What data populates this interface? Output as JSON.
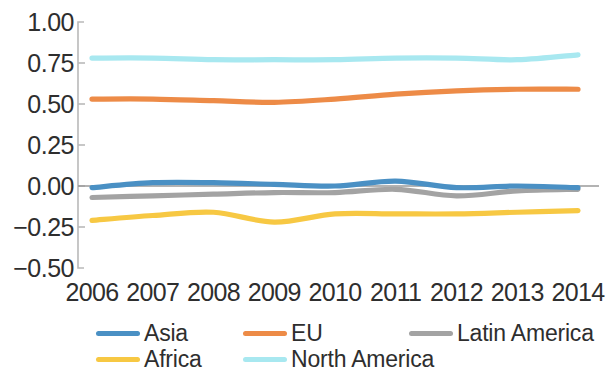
{
  "chart_data": {
    "type": "line",
    "title": "",
    "subtitle": "",
    "xlabel": "",
    "ylabel": "",
    "categories": [
      "2006",
      "2007",
      "2008",
      "2009",
      "2010",
      "2011",
      "2012",
      "2013",
      "2014"
    ],
    "x": [
      2006,
      2007,
      2008,
      2009,
      2010,
      2011,
      2012,
      2013,
      2014
    ],
    "ylim": [
      -0.5,
      1.0
    ],
    "ytick_labels": [
      "1.00",
      "0.75",
      "0.50",
      "0.25",
      "0.00",
      "-0.25",
      "-0.50"
    ],
    "ytick_values": [
      1.0,
      0.75,
      0.5,
      0.25,
      0.0,
      -0.25,
      -0.5
    ],
    "grid": false,
    "zero_line": true,
    "legend_position": "bottom",
    "series": [
      {
        "name": "Asia",
        "color": "#4A90C4",
        "values": [
          -0.01,
          0.02,
          0.02,
          0.01,
          0.0,
          0.03,
          -0.01,
          0.0,
          -0.01
        ]
      },
      {
        "name": "EU",
        "color": "#ED8B47",
        "values": [
          0.53,
          0.53,
          0.52,
          0.51,
          0.53,
          0.56,
          0.58,
          0.59,
          0.59
        ]
      },
      {
        "name": "Latin America",
        "color": "#A3A3A3",
        "values": [
          -0.07,
          -0.06,
          -0.05,
          -0.04,
          -0.04,
          -0.02,
          -0.06,
          -0.03,
          -0.02
        ]
      },
      {
        "name": "Africa",
        "color": "#F7C843",
        "values": [
          -0.21,
          -0.18,
          -0.16,
          -0.22,
          -0.17,
          -0.17,
          -0.17,
          -0.16,
          -0.15
        ]
      },
      {
        "name": "North America",
        "color": "#A8E8F0",
        "values": [
          0.78,
          0.78,
          0.77,
          0.77,
          0.77,
          0.78,
          0.78,
          0.77,
          0.8
        ]
      }
    ]
  },
  "legend": {
    "items": [
      {
        "label": "Asia",
        "color": "#4A90C4",
        "row": 0,
        "col": 0
      },
      {
        "label": "EU",
        "color": "#ED8B47",
        "row": 0,
        "col": 1
      },
      {
        "label": "Latin America",
        "color": "#A3A3A3",
        "row": 0,
        "col": 2
      },
      {
        "label": "Africa",
        "color": "#F7C843",
        "row": 1,
        "col": 0
      },
      {
        "label": "North America",
        "color": "#A8E8F0",
        "row": 1,
        "col": 1
      }
    ]
  },
  "axis": {
    "spine_color": "#b9b9b9",
    "zero_line_color": "#9a9a9a",
    "tick_color": "#b9b9b9"
  }
}
